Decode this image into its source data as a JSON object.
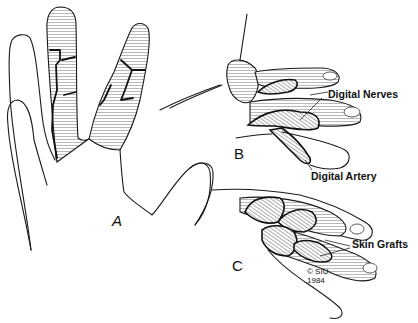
{
  "figure": {
    "panels": [
      {
        "id": "A",
        "label": "A"
      },
      {
        "id": "B",
        "label": "B"
      },
      {
        "id": "C",
        "label": "C"
      }
    ],
    "annotations": {
      "digital_nerves": "Digital Nerves",
      "digital_artery": "Digital Artery",
      "skin_grafts": "Skin Grafts"
    },
    "copyright": {
      "line1": "© SIU",
      "line2": "1984"
    }
  }
}
